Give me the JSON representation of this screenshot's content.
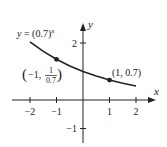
{
  "chart_data": {
    "type": "line",
    "title": "",
    "function_label": "y = (0.7)^x",
    "function_label_parts": {
      "lhs": "y = (0.7)",
      "exp": "x"
    },
    "xlabel": "x",
    "ylabel": "y",
    "xlim": [
      -2.5,
      2.7
    ],
    "ylim": [
      -1.5,
      2.7
    ],
    "grid": false,
    "legend": "none",
    "x_ticks": [
      -2,
      -1,
      1,
      2
    ],
    "x_tick_labels": [
      "−2",
      "−1",
      "1",
      "2"
    ],
    "y_ticks": [
      2,
      -1
    ],
    "y_tick_labels": [
      "2",
      "−1"
    ],
    "series": [
      {
        "name": "y = (0.7)^x",
        "x": [
          -2,
          -1.5,
          -1,
          -0.5,
          0,
          0.5,
          1,
          1.5,
          2
        ],
        "y": [
          2.041,
          1.707,
          1.429,
          1.195,
          1.0,
          0.837,
          0.7,
          0.586,
          0.49
        ]
      }
    ],
    "annotations": [
      {
        "point": [
          -1,
          1.4286
        ],
        "label_prefix": "(−1, ",
        "frac_num": "1",
        "frac_den": "0.7",
        "label_suffix": ")"
      },
      {
        "point": [
          1,
          0.7
        ],
        "label": "(1, 0.7)"
      }
    ]
  },
  "colors": {
    "ink": "#222222",
    "background": "#ffffff"
  }
}
